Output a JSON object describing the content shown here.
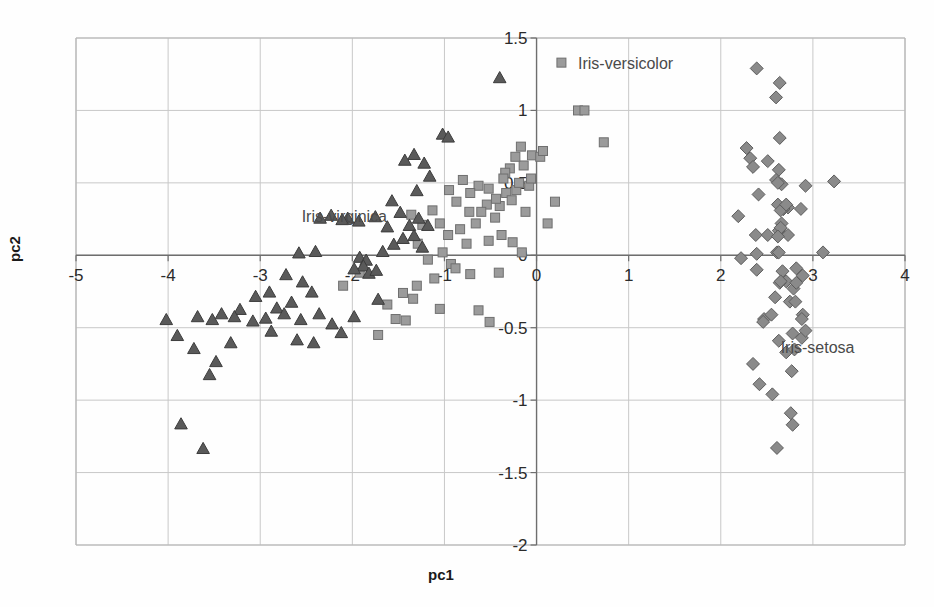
{
  "figure": {
    "background": "#fefefe",
    "width": 934,
    "height": 607
  },
  "axes": {
    "xlabel": "pc1",
    "ylabel": "pc2",
    "xlim": [
      -5,
      4
    ],
    "ylim": [
      -2,
      1.5
    ],
    "xticks": [
      -5,
      -4,
      -3,
      -2,
      -1,
      0,
      1,
      2,
      3,
      4
    ],
    "xtick_labels": [
      "-5",
      "-4",
      "-3",
      "-2",
      "-1",
      "0",
      "1",
      "2",
      "3",
      "4"
    ],
    "yticks": [
      -2,
      -1.5,
      -1,
      -0.5,
      0,
      0.5,
      1,
      1.5
    ],
    "ytick_labels": [
      "-2",
      "-1.5",
      "-1",
      "-0.5",
      "0",
      "0.5",
      "1",
      "1.5"
    ],
    "grid": true,
    "grid_color": "#c8c8c8",
    "axis_color": "#6e6e6e",
    "frame_color": "#b6b6b6",
    "zero_x_axis": 0,
    "zero_y_axis": 0
  },
  "annotations": [
    {
      "text": "Iris-versicolor",
      "x": 0.45,
      "y": 1.33,
      "marker": "square",
      "marker_dx": -0.18,
      "anchor": "start"
    },
    {
      "text": "Iris-virginica",
      "x": -2.55,
      "y": 0.27,
      "marker": "none",
      "marker_dx": 0,
      "anchor": "start"
    },
    {
      "text": "Iris-setosa",
      "x": 2.65,
      "y": -0.63,
      "marker": "none",
      "marker_dx": 0,
      "anchor": "start"
    }
  ],
  "chart_data": {
    "type": "scatter",
    "title": "",
    "xlabel": "pc1",
    "ylabel": "pc2",
    "xlim": [
      -5,
      4
    ],
    "ylim": [
      -2,
      1.5
    ],
    "grid": true,
    "legend_position": "inline-annotations",
    "series": [
      {
        "name": "Iris-setosa",
        "marker": "diamond",
        "color": "#8a8a8a",
        "edge_color": "#5d5d5d",
        "size": 9,
        "points": [
          [
            2.68,
            0.32
          ],
          [
            2.71,
            -0.18
          ],
          [
            2.89,
            -0.14
          ],
          [
            2.75,
            -0.32
          ],
          [
            2.73,
            0.33
          ],
          [
            2.28,
            0.74
          ],
          [
            2.82,
            -0.09
          ],
          [
            2.63,
            0.17
          ],
          [
            2.88,
            -0.57
          ],
          [
            2.67,
            -0.11
          ],
          [
            2.51,
            0.65
          ],
          [
            2.61,
            0.02
          ],
          [
            2.79,
            -0.23
          ],
          [
            3.23,
            0.51
          ],
          [
            2.64,
            1.19
          ],
          [
            2.39,
            1.29
          ],
          [
            2.92,
            0.48
          ],
          [
            2.68,
            0.32
          ],
          [
            2.32,
            0.67
          ],
          [
            2.63,
            0.59
          ],
          [
            2.19,
            0.27
          ],
          [
            2.6,
            0.52
          ],
          [
            3.11,
            0.02
          ],
          [
            2.38,
            0.14
          ],
          [
            2.39,
            -0.1
          ],
          [
            2.22,
            -0.02
          ],
          [
            2.51,
            0.14
          ],
          [
            2.62,
            0.35
          ],
          [
            2.65,
            0.31
          ],
          [
            2.64,
            -0.19
          ],
          [
            2.59,
            -0.29
          ],
          [
            2.41,
            0.42
          ],
          [
            2.64,
            0.81
          ],
          [
            2.6,
            1.09
          ],
          [
            2.39,
            0.01
          ],
          [
            2.63,
            0.02
          ],
          [
            2.87,
            0.32
          ],
          [
            2.73,
            0.14
          ],
          [
            2.89,
            -0.41
          ],
          [
            2.66,
            0.22
          ],
          [
            2.71,
            0.35
          ],
          [
            2.56,
            -0.96
          ],
          [
            2.81,
            -0.32
          ],
          [
            2.65,
            0.19
          ],
          [
            2.35,
            0.61
          ],
          [
            2.65,
            -0.18
          ],
          [
            2.66,
            0.49
          ],
          [
            2.82,
            -0.19
          ],
          [
            2.62,
            0.5
          ],
          [
            2.62,
            0.13
          ],
          [
            2.47,
            -0.44
          ],
          [
            2.46,
            -0.46
          ],
          [
            2.92,
            -0.52
          ],
          [
            2.78,
            -0.54
          ],
          [
            2.71,
            -0.67
          ],
          [
            2.8,
            -0.65
          ],
          [
            2.35,
            -0.75
          ],
          [
            2.42,
            -0.89
          ],
          [
            2.77,
            -0.8
          ],
          [
            2.76,
            -1.09
          ],
          [
            2.78,
            -1.17
          ],
          [
            2.61,
            -1.33
          ],
          [
            2.55,
            -0.41
          ],
          [
            2.88,
            -0.44
          ],
          [
            2.63,
            -0.59
          ]
        ]
      },
      {
        "name": "Iris-versicolor",
        "marker": "square",
        "color": "#9b9b9b",
        "edge_color": "#6f6f6f",
        "size": 9,
        "points": [
          [
            -0.17,
            0.75
          ],
          [
            -0.29,
            0.6
          ],
          [
            -0.14,
            0.62
          ],
          [
            -0.34,
            0.57
          ],
          [
            -0.23,
            0.68
          ],
          [
            -0.22,
            0.45
          ],
          [
            -0.36,
            0.53
          ],
          [
            -0.05,
            0.69
          ],
          [
            -0.19,
            0.5
          ],
          [
            -0.33,
            0.43
          ],
          [
            -0.27,
            0.38
          ],
          [
            -0.4,
            0.34
          ],
          [
            -0.44,
            0.39
          ],
          [
            -0.52,
            0.46
          ],
          [
            -0.63,
            0.48
          ],
          [
            -0.54,
            0.35
          ],
          [
            -0.45,
            0.26
          ],
          [
            -0.6,
            0.3
          ],
          [
            -0.72,
            0.43
          ],
          [
            -0.8,
            0.52
          ],
          [
            -0.12,
            0.3
          ],
          [
            -0.08,
            0.48
          ],
          [
            0.04,
            0.68
          ],
          [
            0.07,
            0.72
          ],
          [
            -0.06,
            0.53
          ],
          [
            0.12,
            0.22
          ],
          [
            0.2,
            0.37
          ],
          [
            0.45,
            1.0
          ],
          [
            0.52,
            1.0
          ],
          [
            0.73,
            0.78
          ],
          [
            -0.66,
            0.22
          ],
          [
            -0.73,
            0.3
          ],
          [
            -0.87,
            0.37
          ],
          [
            -0.95,
            0.45
          ],
          [
            -0.83,
            0.18
          ],
          [
            -0.96,
            0.14
          ],
          [
            -1.05,
            0.22
          ],
          [
            -1.13,
            0.31
          ],
          [
            -1.24,
            0.21
          ],
          [
            -1.36,
            0.28
          ],
          [
            -1.02,
            0.02
          ],
          [
            -1.18,
            -0.03
          ],
          [
            -1.29,
            0.08
          ],
          [
            -0.93,
            -0.06
          ],
          [
            -0.76,
            0.08
          ],
          [
            -0.52,
            0.1
          ],
          [
            -0.38,
            0.14
          ],
          [
            -0.26,
            0.09
          ],
          [
            -0.16,
            0.02
          ],
          [
            -0.41,
            -0.12
          ],
          [
            -0.72,
            -0.13
          ],
          [
            -1.34,
            -0.3
          ],
          [
            -1.45,
            -0.26
          ],
          [
            -1.62,
            -0.34
          ],
          [
            -1.53,
            -0.44
          ],
          [
            -1.72,
            -0.55
          ],
          [
            -1.3,
            -0.21
          ],
          [
            -1.11,
            -0.16
          ],
          [
            -1.92,
            -0.12
          ],
          [
            -2.1,
            -0.21
          ],
          [
            -0.63,
            -0.38
          ],
          [
            -0.51,
            -0.46
          ],
          [
            -1.42,
            -0.45
          ],
          [
            -1.05,
            -0.37
          ],
          [
            -0.88,
            -0.09
          ]
        ]
      },
      {
        "name": "Iris-virginica",
        "marker": "triangle",
        "color": "#5a5a5a",
        "edge_color": "#3c3c3c",
        "size": 9,
        "points": [
          [
            -0.4,
            1.23
          ],
          [
            -1.02,
            0.84
          ],
          [
            -0.96,
            0.82
          ],
          [
            -1.22,
            0.64
          ],
          [
            -1.33,
            0.7
          ],
          [
            -1.43,
            0.66
          ],
          [
            -1.16,
            0.55
          ],
          [
            -1.3,
            0.45
          ],
          [
            -1.57,
            0.38
          ],
          [
            -1.48,
            0.3
          ],
          [
            -1.38,
            0.21
          ],
          [
            -1.28,
            0.26
          ],
          [
            -1.18,
            0.21
          ],
          [
            -1.62,
            0.2
          ],
          [
            -1.75,
            0.27
          ],
          [
            -1.93,
            0.24
          ],
          [
            -2.05,
            0.26
          ],
          [
            -2.23,
            0.28
          ],
          [
            -2.35,
            0.26
          ],
          [
            -2.11,
            0.25
          ],
          [
            -1.45,
            0.12
          ],
          [
            -1.55,
            0.08
          ],
          [
            -1.67,
            0.03
          ],
          [
            -1.33,
            0.14
          ],
          [
            -1.24,
            0.06
          ],
          [
            -2.58,
            0.02
          ],
          [
            -2.4,
            0.03
          ],
          [
            -1.92,
            -0.01
          ],
          [
            -1.85,
            -0.03
          ],
          [
            -1.88,
            -0.07
          ],
          [
            -1.98,
            -0.09
          ],
          [
            -1.82,
            -0.12
          ],
          [
            -1.74,
            -0.1
          ],
          [
            -2.72,
            -0.13
          ],
          [
            -2.54,
            -0.18
          ],
          [
            -2.9,
            -0.25
          ],
          [
            -3.05,
            -0.28
          ],
          [
            -2.82,
            -0.36
          ],
          [
            -2.66,
            -0.32
          ],
          [
            -3.22,
            -0.37
          ],
          [
            -3.42,
            -0.4
          ],
          [
            -3.28,
            -0.42
          ],
          [
            -3.08,
            -0.45
          ],
          [
            -2.94,
            -0.43
          ],
          [
            -2.74,
            -0.4
          ],
          [
            -2.56,
            -0.44
          ],
          [
            -2.36,
            -0.4
          ],
          [
            -2.22,
            -0.47
          ],
          [
            -1.98,
            -0.42
          ],
          [
            -2.88,
            -0.52
          ],
          [
            -3.52,
            -0.44
          ],
          [
            -3.68,
            -0.42
          ],
          [
            -2.6,
            -0.58
          ],
          [
            -2.42,
            -0.6
          ],
          [
            -3.9,
            -0.55
          ],
          [
            -3.72,
            -0.64
          ],
          [
            -3.48,
            -0.73
          ],
          [
            -3.55,
            -0.82
          ],
          [
            -4.02,
            -0.44
          ],
          [
            -3.32,
            -0.6
          ],
          [
            -3.86,
            -1.16
          ],
          [
            -3.62,
            -1.33
          ],
          [
            -2.12,
            -0.53
          ],
          [
            -2.44,
            -0.25
          ],
          [
            -1.72,
            -0.3
          ]
        ]
      }
    ]
  }
}
